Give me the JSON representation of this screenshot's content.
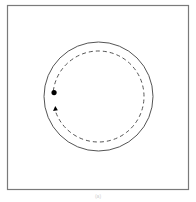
{
  "diagram": {
    "type": "circular-path",
    "elements": {
      "frame": {
        "stroke": "#7a7a7a"
      },
      "outer_circle": {
        "style": "solid",
        "stroke": "#555555"
      },
      "inner_path": {
        "style": "dashed",
        "stroke": "#555555",
        "direction": "clockwise"
      },
      "start_marker": {
        "shape": "dot",
        "fill": "#000000"
      },
      "direction_marker": {
        "shape": "arrowhead",
        "fill": "#000000",
        "points": "up"
      }
    },
    "caption": "(a)"
  }
}
